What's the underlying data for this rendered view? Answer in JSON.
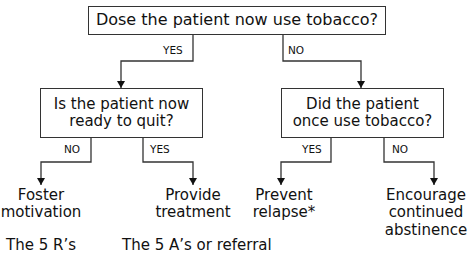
{
  "flowchart": {
    "root": {
      "question": "Dose the patient now use tobacco?",
      "yes_label": "YES",
      "no_label": "NO"
    },
    "left": {
      "question_line1": "Is the patient now",
      "question_line2": "ready to quit?",
      "no_label": "NO",
      "yes_label": "YES",
      "no_outcome_line1": "Foster",
      "no_outcome_line2": "motivation",
      "no_outcome_sub": "The 5 R’s",
      "yes_outcome_line1": "Provide",
      "yes_outcome_line2": "treatment",
      "yes_outcome_sub": "The 5 A’s or referral"
    },
    "right": {
      "question_line1": "Did the patient",
      "question_line2": "once use tobacco?",
      "yes_label": "YES",
      "no_label": "NO",
      "yes_outcome_line1": "Prevent",
      "yes_outcome_line2": "relapse*",
      "no_outcome_line1": "Encourage",
      "no_outcome_line2": "continued",
      "no_outcome_line3": "abstinence"
    }
  }
}
